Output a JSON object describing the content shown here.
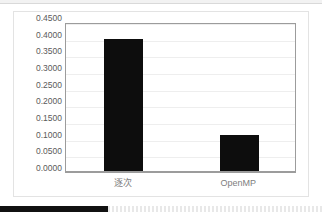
{
  "chart_data": {
    "type": "bar",
    "title": "",
    "subtitle": "",
    "xlabel": "",
    "ylabel": "",
    "categories": [
      "逐次",
      "OpenMP"
    ],
    "values": [
      0.4,
      0.11
    ],
    "series": [
      {
        "name": "",
        "values": [
          0.4,
          0.11
        ]
      }
    ],
    "ylim": [
      0.0,
      0.45
    ],
    "ytick_step": 0.05,
    "ytick_labels": [
      "0.0000",
      "0.0500",
      "0.1000",
      "0.1500",
      "0.2000",
      "0.2500",
      "0.3000",
      "0.3500",
      "0.4000",
      "0.4500"
    ],
    "grid": true,
    "grid_axis": "y",
    "legend": false,
    "legend_position": "none",
    "bar_color": "#0d0d0d",
    "gridline_color": "#eeeeee",
    "axis_line_color": "#9c9c9c",
    "tick_label_color": "#5a5a5a",
    "category_label_color": "#808080",
    "plot_background": "#ffffff"
  },
  "frame": {
    "border_color": "#e3e3e3",
    "background": "#ffffff"
  },
  "top_band": {
    "background": "#f2f2f2",
    "rule_color": "#d9d9d9"
  },
  "bottom_bar": {
    "progress_color": "#111111",
    "track_color": "#e8e8e8"
  }
}
